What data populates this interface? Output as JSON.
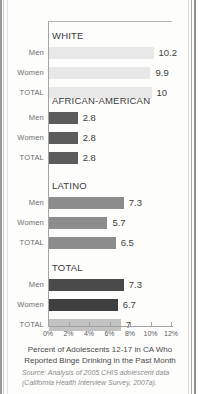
{
  "chart_data": {
    "type": "bar",
    "orientation": "horizontal",
    "title": "",
    "xlabel": "Percent of Adolescents 12-17 in CA Who Reported Binge Drinking in the Past Month",
    "ylabel": "",
    "xlim": [
      0,
      12
    ],
    "xticks": [
      "0%",
      "2%",
      "4%",
      "6%",
      "8%",
      "10%",
      "12%"
    ],
    "xtick_values": [
      0,
      2,
      4,
      6,
      8,
      10,
      12
    ],
    "grid": false,
    "legend": "none",
    "groups": [
      {
        "name": "WHITE",
        "color": "#e8e8e8",
        "categories": [
          "Men",
          "Women",
          "TOTAL"
        ],
        "values": [
          10.2,
          9.9,
          10
        ],
        "labels": [
          "10.2",
          "9.9",
          "10"
        ]
      },
      {
        "name": "AFRICAN-AMERICAN",
        "color": "#5c5c5c",
        "categories": [
          "Men",
          "Women",
          "TOTAL"
        ],
        "values": [
          2.8,
          2.8,
          2.8
        ],
        "labels": [
          "2.8",
          "2.8",
          "2.8"
        ]
      },
      {
        "name": "LATINO",
        "color": "#8c8c8c",
        "categories": [
          "Men",
          "Women",
          "TOTAL"
        ],
        "values": [
          7.3,
          5.7,
          6.5
        ],
        "labels": [
          "7.3",
          "5.7",
          "6.5"
        ]
      },
      {
        "name": "TOTAL",
        "color": "#4a4a4a",
        "categories": [
          "Men",
          "Women",
          "TOTAL"
        ],
        "values": [
          7.3,
          6.7,
          7
        ],
        "labels": [
          "7.3",
          "6.7",
          "7"
        ],
        "row_colors": [
          "#4a4a4a",
          "#3f3f3f",
          "#c2c2c2"
        ]
      }
    ]
  },
  "caption": {
    "line1": "Percent of Adolescents 12-17 in CA Who",
    "line2": "Reported Binge Drinking in the Past Month"
  },
  "source": {
    "line1": "Source: Analysis of 2005 CHIS adolescent data",
    "line2": "(California Health Interview Survey, 2007a)."
  },
  "top_ghost": "· ·            ·"
}
